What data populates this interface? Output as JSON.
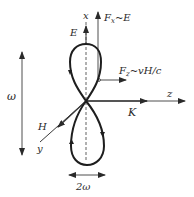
{
  "figure": {
    "type": "trajectory-diagram",
    "colors": {
      "ink": "#1e1e1e",
      "thin_ink": "#3a3a3a",
      "background": "#ffffff"
    }
  },
  "labels": {
    "x_axis": "x",
    "z_axis": "z",
    "y_axis": "y",
    "electric_field": "E",
    "magnetic_field": "H",
    "wave_vector": "K",
    "force_x": "F",
    "force_x_sub": "x",
    "force_x_rel": "~E",
    "force_z": "F",
    "force_z_sub": "z",
    "force_z_rel": "~vH/c",
    "vertical_frequency": "ω",
    "horizontal_frequency": "2ω"
  }
}
